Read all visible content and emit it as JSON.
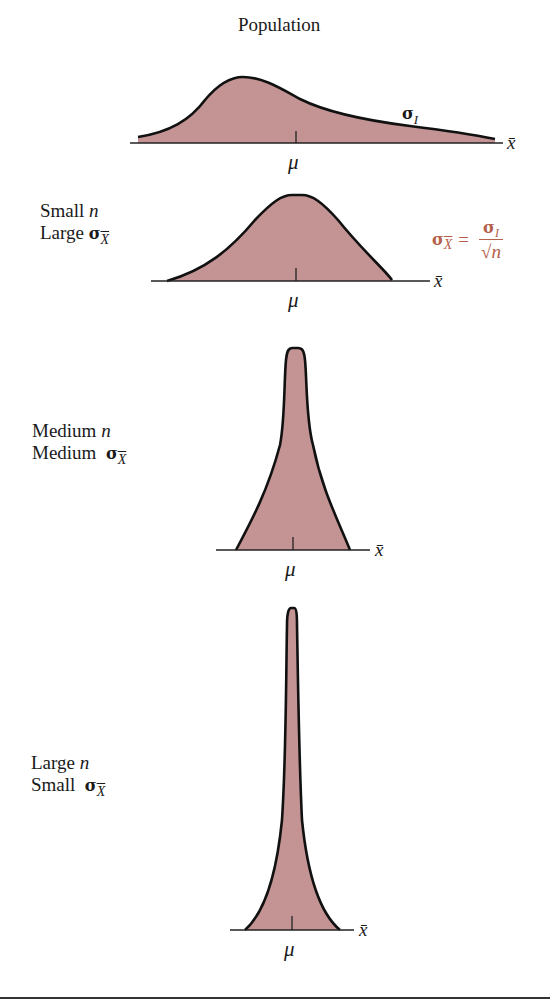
{
  "title": "Population",
  "population": {
    "sigma_label": "σ",
    "sigma_sub": "I",
    "mean_label": "μ",
    "axis_label": "x̄"
  },
  "panels": [
    {
      "line1_prefix": "Small",
      "line1_var": "n",
      "line2_prefix": "Large",
      "sigma": "σ",
      "sigma_sub": "X",
      "mean_label": "μ",
      "axis_label": "x̄"
    },
    {
      "line1_prefix": "Medium",
      "line1_var": "n",
      "line2_prefix": "Medium",
      "sigma": "σ",
      "sigma_sub": "X",
      "mean_label": "μ",
      "axis_label": "x̄"
    },
    {
      "line1_prefix": "Large",
      "line1_var": "n",
      "line2_prefix": "Small",
      "sigma": "σ",
      "sigma_sub": "X",
      "mean_label": "μ",
      "axis_label": "x̄"
    }
  ],
  "formula": {
    "lhs": "σ",
    "lhs_sub": "X",
    "equals": "=",
    "numerator": "σ",
    "numerator_sub": "I",
    "denominator": "√n"
  },
  "colors": {
    "fill": "#c49494",
    "stroke": "#111111",
    "formula": "#b5604a"
  }
}
